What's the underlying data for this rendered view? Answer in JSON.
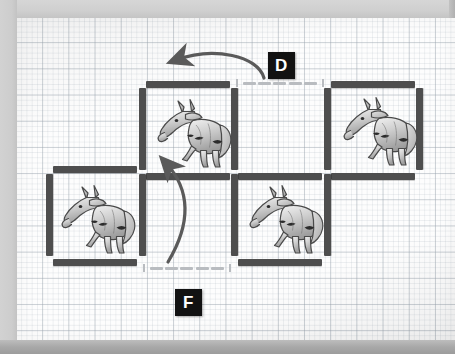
{
  "diagram": {
    "background": "graph-paper",
    "colors": {
      "fence": "#4e4e4e",
      "gate": "#b9bcc0",
      "label_bg": "#121212",
      "label_text": "#ffffff",
      "arrow": "#5a5a5a",
      "paper": "#fdfdfd",
      "grid_line": "#96a0aa",
      "frame": "#c9c9c9"
    },
    "labels": [
      {
        "id": "label-d",
        "text": "D",
        "x": 268,
        "y": 52,
        "describes": "open gate on top-middle pen north side"
      },
      {
        "id": "label-f",
        "text": "F",
        "x": 175,
        "y": 289,
        "describes": "open gate on bottom-middle pen south side"
      }
    ],
    "pens": [
      {
        "id": "pen-top-middle",
        "row": 1,
        "col": 2,
        "has_horse": true,
        "x": 140,
        "y": 84,
        "w": 93,
        "h": 86
      },
      {
        "id": "pen-top-right",
        "row": 1,
        "col": 3,
        "has_horse": true,
        "x": 326,
        "y": 84,
        "w": 93,
        "h": 86
      },
      {
        "id": "pen-middle-open",
        "row": 1,
        "col": 2.5,
        "has_horse": false,
        "x": 233,
        "y": 84,
        "w": 93,
        "h": 86
      },
      {
        "id": "pen-bottom-left",
        "row": 2,
        "col": 1,
        "has_horse": true,
        "x": 47,
        "y": 170,
        "w": 93,
        "h": 86
      },
      {
        "id": "pen-bottom-middle",
        "row": 2,
        "col": 2,
        "has_horse": true,
        "x": 233,
        "y": 170,
        "w": 93,
        "h": 86
      }
    ],
    "horses": [
      {
        "id": "horse-top-middle",
        "pen": "pen-top-middle",
        "x": 148,
        "y": 92,
        "w": 90,
        "h": 78
      },
      {
        "id": "horse-top-right",
        "pen": "pen-top-right",
        "x": 334,
        "y": 90,
        "w": 90,
        "h": 78
      },
      {
        "id": "horse-bottom-left",
        "pen": "pen-bottom-left",
        "x": 52,
        "y": 178,
        "w": 90,
        "h": 78
      },
      {
        "id": "horse-bottom-middle",
        "pen": "pen-bottom-middle",
        "x": 240,
        "y": 178,
        "w": 90,
        "h": 78
      }
    ],
    "gates": [
      {
        "id": "gate-d",
        "label": "D",
        "orientation": "horizontal",
        "state": "open",
        "x": 236,
        "y": 80,
        "w": 88
      },
      {
        "id": "gate-f",
        "label": "F",
        "orientation": "horizontal",
        "state": "open",
        "x": 143,
        "y": 265,
        "w": 88
      }
    ],
    "arrows": [
      {
        "id": "arrow-d-to-pen",
        "from": "gate-d",
        "to": "pen-top-middle",
        "direction": "right-to-left",
        "style": "curved"
      },
      {
        "id": "arrow-f-to-pen",
        "from": "gate-f",
        "to": "pen-top-middle",
        "direction": "bottom-to-top-left",
        "style": "curved"
      }
    ]
  }
}
